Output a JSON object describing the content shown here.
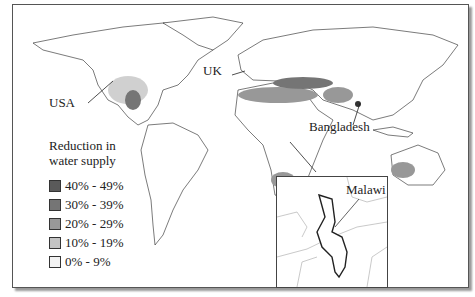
{
  "map": {
    "title": "Reduction in water supply world map",
    "labels": {
      "usa": "USA",
      "uk": "UK",
      "bangladesh": "Bangladesh",
      "malawi": "Malawi"
    },
    "legend": {
      "title_line1": "Reduction in",
      "title_line2": "water supply",
      "items": [
        {
          "label": "40% - 49%",
          "color": "#5a5a5a"
        },
        {
          "label": "30% - 39%",
          "color": "#757575"
        },
        {
          "label": "20% - 29%",
          "color": "#989898"
        },
        {
          "label": "10% - 19%",
          "color": "#c4c4c4"
        },
        {
          "label": "0% - 9%",
          "color": "#f2f2f2"
        }
      ]
    },
    "inset": {
      "label": "Malawi"
    }
  }
}
